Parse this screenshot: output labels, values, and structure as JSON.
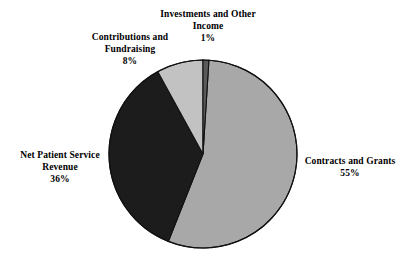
{
  "chart_data": {
    "type": "pie",
    "title": "",
    "subtitle": "",
    "legend_position": "outside-labels",
    "grid": false,
    "total_percent": 100,
    "start_angle_deg": 0,
    "direction": "clockwise",
    "categories": [
      "Investments and Other Income",
      "Contracts and Grants",
      "Net Patient Service Revenue",
      "Contributions and Fundraising"
    ],
    "values": [
      1,
      55,
      36,
      8
    ],
    "slices": [
      {
        "label": "Investments and Other Income",
        "label_line1": "Investments and Other",
        "label_line2": "Income",
        "value": 1,
        "value_text": "1%",
        "color": "#5a5a5a",
        "start_deg": 0,
        "end_deg": 3.6
      },
      {
        "label": "Contracts and Grants",
        "label_line1": "Contracts and Grants",
        "label_line2": "",
        "value": 55,
        "value_text": "55%",
        "color": "#a8a8a8",
        "start_deg": 3.6,
        "end_deg": 201.6
      },
      {
        "label": "Net Patient Service Revenue",
        "label_line1": "Net Patient Service",
        "label_line2": "Revenue",
        "value": 36,
        "value_text": "36%",
        "color": "#1c1c1c",
        "start_deg": 201.6,
        "end_deg": 331.2
      },
      {
        "label": "Contributions and Fundraising",
        "label_line1": "Contributions and",
        "label_line2": "Fundraising",
        "value": 8,
        "value_text": "8%",
        "color": "#c2c2c2",
        "start_deg": 331.2,
        "end_deg": 360
      }
    ],
    "colors": {
      "background": "#ffffff",
      "outline": "#000000",
      "text": "#000000",
      "slice_contracts_and_grants": "#a8a8a8",
      "slice_net_patient_service_revenue": "#1c1c1c",
      "slice_contributions_and_fundraising": "#c2c2c2",
      "slice_investments_and_other_income": "#5a5a5a"
    }
  },
  "labels": {
    "investments": {
      "name_line1": "Investments and Other",
      "name_line2": "Income",
      "value": "1%"
    },
    "contributions": {
      "name_line1": "Contributions and",
      "name_line2": "Fundraising",
      "value": "8%"
    },
    "net_patient": {
      "name_line1": "Net Patient Service",
      "name_line2": "Revenue",
      "value": "36%"
    },
    "contracts": {
      "name_line1": "Contracts and Grants",
      "name_line2": "",
      "value": "55%"
    }
  }
}
